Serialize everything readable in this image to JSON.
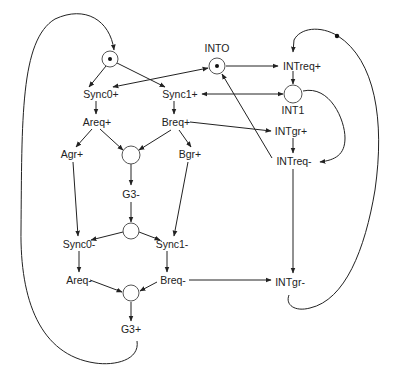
{
  "diagram": {
    "type": "petri-net / signal transition graph",
    "colors": {
      "stroke": "#222222",
      "place_stroke": "#555555",
      "background": "#ffffff"
    },
    "places": [
      {
        "id": "p_top",
        "label": "",
        "x": 110,
        "y": 59,
        "marked": true
      },
      {
        "id": "INTO",
        "label": "INTO",
        "x": 217,
        "y": 66,
        "marked": true
      },
      {
        "id": "INT1",
        "label": "INT1",
        "x": 293,
        "y": 94,
        "marked": false
      },
      {
        "id": "p_mid1",
        "label": "",
        "x": 131,
        "y": 155,
        "marked": false
      },
      {
        "id": "p_mid2",
        "label": "",
        "x": 131,
        "y": 231,
        "marked": false
      },
      {
        "id": "p_bot",
        "label": "",
        "x": 131,
        "y": 293,
        "marked": false
      }
    ],
    "transitions": [
      {
        "id": "sync0p",
        "label": "Sync0+",
        "x": 101,
        "y": 98
      },
      {
        "id": "sync1p",
        "label": "Sync1+",
        "x": 180,
        "y": 98
      },
      {
        "id": "areqp",
        "label": "Areq+",
        "x": 97,
        "y": 126
      },
      {
        "id": "breqp",
        "label": "Breq+",
        "x": 176,
        "y": 126
      },
      {
        "id": "agrp",
        "label": "Agr+",
        "x": 72,
        "y": 158
      },
      {
        "id": "bgrp",
        "label": "Bgr+",
        "x": 190,
        "y": 158
      },
      {
        "id": "g3m",
        "label": "G3-",
        "x": 131,
        "y": 198
      },
      {
        "id": "sync0m",
        "label": "Sync0-",
        "x": 79,
        "y": 248
      },
      {
        "id": "sync1m",
        "label": "Sync1-",
        "x": 172,
        "y": 248
      },
      {
        "id": "areqm",
        "label": "Areq-",
        "x": 79,
        "y": 284
      },
      {
        "id": "breqm",
        "label": "Breq-",
        "x": 173,
        "y": 284
      },
      {
        "id": "g3p",
        "label": "G3+",
        "x": 131,
        "y": 333
      },
      {
        "id": "intreqp",
        "label": "INTreq+",
        "x": 302,
        "y": 70
      },
      {
        "id": "intgrp",
        "label": "INTgr+",
        "x": 291,
        "y": 135
      },
      {
        "id": "intreqm",
        "label": "INTreq-",
        "x": 294,
        "y": 165
      },
      {
        "id": "intgrm",
        "label": "INTgr-",
        "x": 290,
        "y": 286
      }
    ]
  }
}
